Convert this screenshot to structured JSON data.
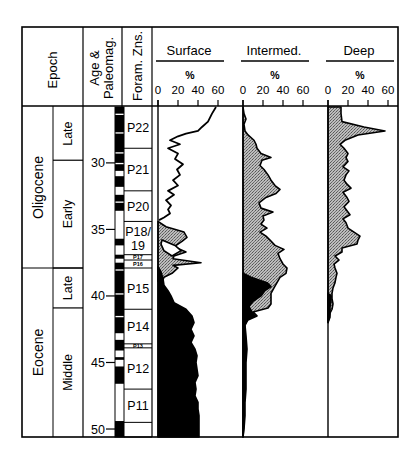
{
  "chart_data": {
    "type": "area",
    "title": "",
    "columns": {
      "epoch": "Epoch",
      "age": "Age & Paleomag.",
      "age_line1": "Age &",
      "age_line2": "Paleomag.",
      "foram": "Foram. Zns."
    },
    "epochs": [
      {
        "name": "Oligocene",
        "top": 25.8,
        "bottom": 37.9
      },
      {
        "name": "Eocene",
        "top": 37.9,
        "bottom": 50.6
      }
    ],
    "sub_epochs": [
      {
        "name": "Late",
        "top": 25.8,
        "bottom": 29.8
      },
      {
        "name": "Early",
        "top": 29.8,
        "bottom": 37.9
      },
      {
        "name": "Late",
        "top": 37.9,
        "bottom": 40.9
      },
      {
        "name": "Middle",
        "top": 40.9,
        "bottom": 50.6
      }
    ],
    "age_ticks": [
      30,
      35,
      40,
      45,
      50
    ],
    "age_range": [
      25.8,
      50.6
    ],
    "foram_zones": [
      {
        "name": "P22",
        "top": 25.8,
        "bottom": 28.9
      },
      {
        "name": "P21",
        "top": 28.9,
        "bottom": 32.1
      },
      {
        "name": "P20",
        "top": 32.1,
        "bottom": 34.4
      },
      {
        "name": "P18/",
        "name2": "19",
        "top": 34.4,
        "bottom": 36.9
      },
      {
        "name": "P17",
        "top": 36.9,
        "bottom": 37.3,
        "small": true
      },
      {
        "name": "P16",
        "top": 37.3,
        "bottom": 37.9,
        "small": true
      },
      {
        "name": "P15",
        "top": 37.9,
        "bottom": 41.0
      },
      {
        "name": "P14",
        "top": 41.0,
        "bottom": 43.6
      },
      {
        "name": "P13",
        "top": 43.6,
        "bottom": 43.9,
        "small": true
      },
      {
        "name": "P12",
        "top": 43.9,
        "bottom": 47.0
      },
      {
        "name": "P11",
        "top": 47.0,
        "bottom": 49.5
      },
      {
        "name": "",
        "top": 49.5,
        "bottom": 50.6
      }
    ],
    "paleomag_normal": [
      [
        25.8,
        26.3
      ],
      [
        26.4,
        27.7
      ],
      [
        27.8,
        29.2
      ],
      [
        29.3,
        30.0
      ],
      [
        30.1,
        30.6
      ],
      [
        31.0,
        31.8
      ],
      [
        32.4,
        32.9
      ],
      [
        33.0,
        33.6
      ],
      [
        35.7,
        36.2
      ],
      [
        36.9,
        37.2
      ],
      [
        37.5,
        38.0
      ],
      [
        38.1,
        39.8
      ],
      [
        39.9,
        41.5
      ],
      [
        41.6,
        42.8
      ],
      [
        43.3,
        44.1
      ],
      [
        44.6,
        44.8
      ],
      [
        45.3,
        46.6
      ],
      [
        49.4,
        50.6
      ]
    ],
    "panels": [
      {
        "name": "Surface",
        "xlabel": "%",
        "xticks": [
          0,
          20,
          40,
          60
        ],
        "xlim": [
          0,
          60
        ],
        "outline": [
          [
            25.8,
            58
          ],
          [
            26.3,
            54
          ],
          [
            26.9,
            50
          ],
          [
            27.3,
            44
          ],
          [
            27.6,
            40
          ],
          [
            27.8,
            28
          ],
          [
            28.0,
            20
          ],
          [
            28.3,
            12
          ],
          [
            28.6,
            22
          ],
          [
            28.9,
            10
          ],
          [
            29.3,
            20
          ],
          [
            29.7,
            17
          ],
          [
            30.1,
            25
          ],
          [
            30.5,
            19
          ],
          [
            30.9,
            22
          ],
          [
            31.3,
            15
          ],
          [
            31.7,
            20
          ],
          [
            32.1,
            10
          ],
          [
            32.4,
            16
          ],
          [
            32.8,
            8
          ],
          [
            33.2,
            13
          ],
          [
            33.5,
            10
          ],
          [
            33.8,
            12
          ],
          [
            34.1,
            6
          ],
          [
            34.3,
            1
          ]
        ],
        "shaded_light": [
          [
            34.4,
            0
          ],
          [
            34.8,
            8
          ],
          [
            35.2,
            26
          ],
          [
            35.6,
            29
          ],
          [
            35.9,
            24
          ],
          [
            36.3,
            16
          ],
          [
            36.7,
            28
          ],
          [
            37.0,
            16
          ],
          [
            37.2,
            15
          ],
          [
            37.5,
            43
          ],
          [
            37.7,
            15
          ],
          [
            37.9,
            20
          ],
          [
            38.3,
            14
          ],
          [
            38.6,
            6
          ],
          [
            38.9,
            4
          ]
        ],
        "inner_white": [
          [
            35.8,
            4
          ],
          [
            36.2,
            17
          ],
          [
            36.6,
            23
          ],
          [
            37.0,
            14
          ],
          [
            36.6,
            6
          ],
          [
            36.1,
            3
          ]
        ],
        "shaded_dark": [
          [
            37.8,
            0
          ],
          [
            38.2,
            3
          ],
          [
            38.7,
            5
          ],
          [
            39.2,
            6
          ],
          [
            39.6,
            10
          ],
          [
            40.0,
            13
          ],
          [
            40.5,
            16
          ],
          [
            41.0,
            28
          ],
          [
            41.5,
            34
          ],
          [
            42.0,
            36
          ],
          [
            42.5,
            33
          ],
          [
            43.0,
            36
          ],
          [
            43.5,
            33
          ],
          [
            44.0,
            37
          ],
          [
            44.5,
            39
          ],
          [
            45.0,
            38
          ],
          [
            45.5,
            39
          ],
          [
            46.0,
            40
          ],
          [
            46.5,
            37
          ],
          [
            47.0,
            38
          ],
          [
            47.5,
            37
          ],
          [
            48.0,
            40
          ],
          [
            48.5,
            40
          ],
          [
            49.0,
            41
          ],
          [
            49.5,
            41
          ],
          [
            50.0,
            41
          ],
          [
            50.6,
            41
          ]
        ]
      },
      {
        "name": "Intermed.",
        "xlabel": "%",
        "xticks": [
          0,
          20,
          40,
          60
        ],
        "xlim": [
          0,
          60
        ],
        "shaded_light": [
          [
            25.8,
            0
          ],
          [
            26.3,
            1
          ],
          [
            26.7,
            3
          ],
          [
            27.1,
            1
          ],
          [
            27.6,
            2
          ],
          [
            27.9,
            5
          ],
          [
            28.3,
            11
          ],
          [
            28.6,
            13
          ],
          [
            28.9,
            14
          ],
          [
            29.3,
            18
          ],
          [
            29.6,
            28
          ],
          [
            29.8,
            19
          ],
          [
            30.2,
            17
          ],
          [
            30.5,
            21
          ],
          [
            30.9,
            25
          ],
          [
            31.3,
            28
          ],
          [
            31.7,
            32
          ],
          [
            32.0,
            37
          ],
          [
            32.3,
            33
          ],
          [
            32.6,
            23
          ],
          [
            33.0,
            16
          ],
          [
            33.4,
            18
          ],
          [
            33.7,
            30
          ],
          [
            34.0,
            20
          ],
          [
            34.3,
            21
          ],
          [
            34.6,
            18
          ],
          [
            34.9,
            24
          ],
          [
            35.2,
            17
          ],
          [
            35.5,
            23
          ],
          [
            35.8,
            27
          ],
          [
            36.2,
            32
          ],
          [
            36.5,
            41
          ],
          [
            36.8,
            35
          ],
          [
            37.2,
            37
          ],
          [
            37.6,
            40
          ],
          [
            37.9,
            44
          ],
          [
            38.3,
            43
          ],
          [
            38.6,
            37
          ],
          [
            39.0,
            34
          ],
          [
            39.4,
            31
          ],
          [
            39.8,
            28
          ],
          [
            40.2,
            28
          ],
          [
            40.6,
            28
          ],
          [
            40.9,
            25
          ],
          [
            41.2,
            10
          ],
          [
            41.5,
            14
          ],
          [
            41.8,
            5
          ],
          [
            42.2,
            2
          ],
          [
            42.6,
            2
          ],
          [
            43.0,
            2
          ],
          [
            44.0,
            2
          ],
          [
            45.0,
            2
          ],
          [
            46.0,
            2
          ],
          [
            47.0,
            2
          ],
          [
            48.0,
            1
          ],
          [
            49.5,
            1
          ],
          [
            50.6,
            0
          ]
        ],
        "shaded_dark": [
          [
            38.3,
            0
          ],
          [
            38.6,
            8
          ],
          [
            39.0,
            24
          ],
          [
            39.3,
            28
          ],
          [
            39.6,
            22
          ],
          [
            40.0,
            18
          ],
          [
            40.4,
            10
          ],
          [
            40.8,
            6
          ],
          [
            41.2,
            9
          ],
          [
            41.5,
            12
          ],
          [
            41.8,
            4
          ],
          [
            42.2,
            2
          ],
          [
            43.0,
            3
          ],
          [
            44.0,
            4
          ],
          [
            45.0,
            3
          ],
          [
            46.0,
            3
          ],
          [
            47.0,
            3
          ],
          [
            48.0,
            2
          ],
          [
            49.0,
            2
          ],
          [
            50.0,
            1
          ],
          [
            50.6,
            0
          ]
        ]
      },
      {
        "name": "Deep",
        "xlabel": "%",
        "xticks": [
          0,
          20,
          40,
          60
        ],
        "xlim": [
          0,
          60
        ],
        "shaded_light": [
          [
            25.8,
            13
          ],
          [
            26.3,
            13
          ],
          [
            26.9,
            14
          ],
          [
            27.3,
            36
          ],
          [
            27.6,
            57
          ],
          [
            27.9,
            30
          ],
          [
            28.3,
            17
          ],
          [
            28.6,
            12
          ],
          [
            28.9,
            16
          ],
          [
            29.3,
            20
          ],
          [
            29.6,
            18
          ],
          [
            29.9,
            20
          ],
          [
            30.3,
            15
          ],
          [
            30.6,
            21
          ],
          [
            30.9,
            18
          ],
          [
            31.3,
            16
          ],
          [
            31.6,
            19
          ],
          [
            31.9,
            23
          ],
          [
            32.2,
            15
          ],
          [
            32.6,
            19
          ],
          [
            32.9,
            21
          ],
          [
            33.3,
            16
          ],
          [
            33.6,
            19
          ],
          [
            33.9,
            22
          ],
          [
            34.2,
            15
          ],
          [
            34.5,
            18
          ],
          [
            34.9,
            20
          ],
          [
            35.2,
            26
          ],
          [
            35.5,
            32
          ],
          [
            35.8,
            30
          ],
          [
            36.1,
            29
          ],
          [
            36.4,
            14
          ],
          [
            36.7,
            14
          ],
          [
            37.0,
            7
          ],
          [
            37.3,
            11
          ],
          [
            37.6,
            6
          ],
          [
            37.9,
            7
          ],
          [
            38.3,
            9
          ],
          [
            38.6,
            8
          ],
          [
            39.0,
            7
          ],
          [
            39.4,
            5
          ],
          [
            39.8,
            4
          ],
          [
            40.2,
            4
          ],
          [
            40.6,
            5
          ],
          [
            41.0,
            4
          ],
          [
            41.3,
            2
          ],
          [
            41.6,
            1
          ],
          [
            42.0,
            0
          ]
        ],
        "shaded_dark": [
          [
            39.8,
            0
          ],
          [
            40.0,
            3
          ],
          [
            40.4,
            3
          ],
          [
            40.8,
            2
          ],
          [
            41.2,
            2
          ],
          [
            41.6,
            2
          ],
          [
            42.0,
            0
          ]
        ]
      }
    ]
  }
}
